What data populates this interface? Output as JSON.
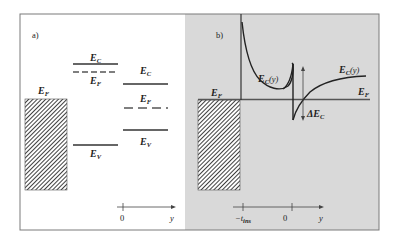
{
  "figure": {
    "colors": {
      "frame": "#7a7a7a",
      "panel_a_bg": "#ffffff",
      "panel_b_bg": "#d9d9d9",
      "line": "#333333",
      "hatch": "#2a2a2a"
    },
    "panel_a": {
      "label": "a)",
      "metal_label": "E",
      "metal_label_sub": "F",
      "semiconductor_left": {
        "ec_label": "E",
        "ec_sub": "C",
        "ef_label": "E",
        "ef_sub": "F",
        "ev_label": "E",
        "ev_sub": "V"
      },
      "semiconductor_right": {
        "ec_label": "E",
        "ec_sub": "C",
        "ef_label": "E",
        "ef_sub": "F",
        "ev_label": "E",
        "ev_sub": "V"
      },
      "axis": {
        "origin_label": "0",
        "axis_label": "y"
      }
    },
    "panel_b": {
      "label": "b)",
      "metal_label": "E",
      "metal_label_sub": "F",
      "fermi_label": "E",
      "fermi_label_sub": "F",
      "curve_left_label": "E",
      "curve_left_sub": "C",
      "curve_left_arg": "(y)",
      "curve_right_label": "E",
      "curve_right_sub": "C",
      "curve_right_arg": "(y)",
      "offset_label": "ΔE",
      "offset_sub": "C",
      "axis": {
        "tick_left_label": "−t",
        "tick_left_sub": "ins",
        "origin_label": "0",
        "axis_label": "y"
      }
    }
  }
}
